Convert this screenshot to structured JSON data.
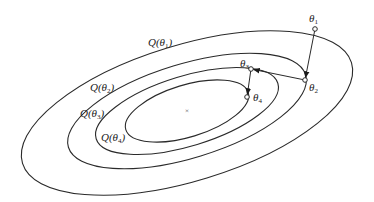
{
  "diagram": {
    "title": "",
    "center_marker": "×",
    "contours": [
      {
        "id": "q1",
        "label_main": "Q(θ",
        "label_sub": "1",
        "label_close": ")",
        "cx": 187,
        "cy": 113,
        "rx": 172,
        "ry": 68,
        "rotate": -17,
        "label_x": 148,
        "label_y": 46
      },
      {
        "id": "q2",
        "label_main": "Q(θ",
        "label_sub": "2",
        "label_close": ")",
        "cx": 187,
        "cy": 111,
        "rx": 124,
        "ry": 47,
        "rotate": -17,
        "label_x": 90,
        "label_y": 91
      },
      {
        "id": "q3",
        "label_main": "Q(θ",
        "label_sub": "3",
        "label_close": ")",
        "cx": 187,
        "cy": 111,
        "rx": 95,
        "ry": 35,
        "rotate": -17,
        "label_x": 80,
        "label_y": 117
      },
      {
        "id": "q4",
        "label_main": "Q(θ",
        "label_sub": "4",
        "label_close": ")",
        "cx": 187,
        "cy": 111,
        "rx": 64,
        "ry": 26,
        "rotate": -17,
        "label_x": 101,
        "label_y": 141
      }
    ],
    "points": [
      {
        "id": "theta1",
        "name": "θ",
        "sub": "1",
        "x": 315,
        "y": 29,
        "label_x": 309,
        "label_y": 22
      },
      {
        "id": "theta2",
        "name": "θ",
        "sub": "2",
        "x": 305,
        "y": 80,
        "label_x": 309,
        "label_y": 91
      },
      {
        "id": "theta3",
        "name": "θ",
        "sub": "3",
        "x": 251,
        "y": 69,
        "label_x": 240,
        "label_y": 67
      },
      {
        "id": "theta4",
        "name": "θ",
        "sub": "4",
        "x": 247,
        "y": 97,
        "label_x": 253,
        "label_y": 101
      }
    ],
    "center": {
      "x": 187,
      "y": 111
    },
    "line_color": "#2a2a2a"
  }
}
